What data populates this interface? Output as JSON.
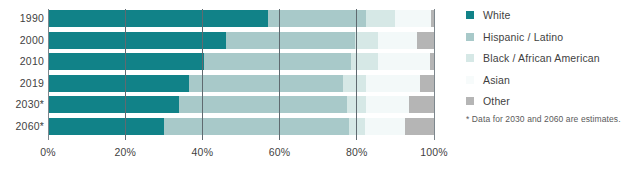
{
  "chart_data": {
    "type": "bar",
    "orientation": "horizontal",
    "stacked": true,
    "stack_mode": "percent",
    "title": "",
    "xlabel": "",
    "ylabel": "",
    "xlim": [
      0,
      100
    ],
    "grid": true,
    "gridlines": [
      0,
      20,
      40,
      60,
      80,
      100
    ],
    "legend_position": "right",
    "categories": [
      "1990",
      "2000",
      "2010",
      "2019",
      "2030*",
      "2060*"
    ],
    "xticks": [
      0,
      20,
      40,
      60,
      80,
      100
    ],
    "xticklabels": [
      "0%",
      "20%",
      "40%",
      "60%",
      "80%",
      "100%"
    ],
    "series": [
      {
        "name": "White",
        "color": "#118288",
        "values": [
          75.6,
          69.1,
          63.7,
          60.1,
          55.8,
          44.3
        ]
      },
      {
        "name": "Hispanic / Latino",
        "color": "#a8c9c9",
        "values": [
          9.0,
          12.5,
          16.3,
          18.5,
          21.1,
          27.5
        ]
      },
      {
        "name": "Black / African American",
        "color": "#d6e8e6",
        "values": [
          11.7,
          12.1,
          12.2,
          12.5,
          12.7,
          13.0
        ]
      },
      {
        "name": "Asian",
        "color": "#f3f9f9",
        "values": [
          2.8,
          3.6,
          4.7,
          5.6,
          6.6,
          9.1
        ]
      },
      {
        "name": "Other",
        "color": "#b5b5b5",
        "values": [
          0.9,
          2.7,
          3.1,
          3.3,
          3.8,
          6.1
        ]
      }
    ],
    "bar_segments": {
      "1990": [
        {
          "name": "White",
          "start": 0.0,
          "end": 57.0
        },
        {
          "name": "Hispanic / Latino",
          "start": 57.0,
          "end": 82.5
        },
        {
          "name": "Black / African American",
          "start": 82.5,
          "end": 90.0
        },
        {
          "name": "Asian",
          "start": 90.0,
          "end": 99.2
        },
        {
          "name": "Other",
          "start": 99.2,
          "end": 100.0
        }
      ],
      "2000": [
        {
          "name": "White",
          "start": 0.0,
          "end": 46.0
        },
        {
          "name": "Hispanic / Latino",
          "start": 46.0,
          "end": 79.5
        },
        {
          "name": "Black / African American",
          "start": 79.5,
          "end": 85.5
        },
        {
          "name": "Asian",
          "start": 85.5,
          "end": 95.5
        },
        {
          "name": "Other",
          "start": 95.5,
          "end": 100.0
        }
      ],
      "2010": [
        {
          "name": "White",
          "start": 0.0,
          "end": 40.5
        },
        {
          "name": "Hispanic / Latino",
          "start": 40.5,
          "end": 78.5
        },
        {
          "name": "Black / African American",
          "start": 78.5,
          "end": 85.5
        },
        {
          "name": "Asian",
          "start": 85.5,
          "end": 99.0
        },
        {
          "name": "Other",
          "start": 99.0,
          "end": 100.0
        }
      ],
      "2019": [
        {
          "name": "White",
          "start": 0.0,
          "end": 36.5
        },
        {
          "name": "Hispanic / Latino",
          "start": 36.5,
          "end": 76.5
        },
        {
          "name": "Black / African American",
          "start": 76.5,
          "end": 82.5
        },
        {
          "name": "Asian",
          "start": 82.5,
          "end": 96.5
        },
        {
          "name": "Other",
          "start": 96.5,
          "end": 100.0
        }
      ],
      "2030*": [
        {
          "name": "White",
          "start": 0.0,
          "end": 34.0
        },
        {
          "name": "Hispanic / Latino",
          "start": 34.0,
          "end": 77.5
        },
        {
          "name": "Black / African American",
          "start": 77.5,
          "end": 82.5
        },
        {
          "name": "Asian",
          "start": 82.5,
          "end": 93.5
        },
        {
          "name": "Other",
          "start": 93.5,
          "end": 100.0
        }
      ],
      "2060*": [
        {
          "name": "White",
          "start": 0.0,
          "end": 30.0
        },
        {
          "name": "Hispanic / Latino",
          "start": 30.0,
          "end": 78.0
        },
        {
          "name": "Black / African American",
          "start": 78.0,
          "end": 82.0
        },
        {
          "name": "Asian",
          "start": 82.0,
          "end": 92.5
        },
        {
          "name": "Other",
          "start": 92.5,
          "end": 100.0
        }
      ]
    }
  },
  "legend": {
    "items": [
      {
        "label": "White",
        "color": "#118288"
      },
      {
        "label": "Hispanic / Latino",
        "color": "#a8c9c9"
      },
      {
        "label": "Black / African American",
        "color": "#d6e8e6"
      },
      {
        "label": "Asian",
        "color": "#f7fbfb"
      },
      {
        "label": "Other",
        "color": "#b5b5b5"
      }
    ],
    "note": "* Data for 2030 and 2060 are estimates."
  },
  "colors": {
    "white_cat": "#118288",
    "hispanic_cat": "#a8c9c9",
    "black_cat": "#d6e8e6",
    "asian_cat": "#f3f9f9",
    "other_cat": "#b5b5b5",
    "gridline": "#5f6a70",
    "text": "#3f3f3f",
    "background": "#ffffff"
  }
}
